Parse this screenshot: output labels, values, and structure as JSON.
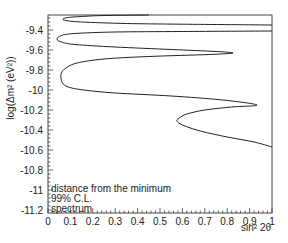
{
  "chart_data": {
    "type": "line",
    "title": "",
    "xlabel": "sin² 2θ",
    "ylabel": "log(Δm² (eV²))",
    "xlim": [
      0,
      1
    ],
    "ylim": [
      -11.23,
      -9.25
    ],
    "x_ticks": [
      0,
      0.1,
      0.2,
      0.3,
      0.4,
      0.5,
      0.6,
      0.7,
      0.8,
      0.9,
      1
    ],
    "x_tick_labels": [
      "0",
      "0.1",
      "0.2",
      "0.3",
      "0.4",
      "0.5",
      "0.6",
      "0.7",
      "0.8",
      "0.9",
      "1"
    ],
    "y_ticks": [
      -9.4,
      -9.6,
      -9.8,
      -10,
      -10.2,
      -10.4,
      -10.6,
      -10.8,
      -11,
      -11.2
    ],
    "y_tick_labels": [
      "-9.4",
      "-9.6",
      "-9.8",
      "-10",
      "-10.2",
      "-10.4",
      "-10.6",
      "-10.8",
      "-11",
      "-11.2"
    ],
    "grid": false,
    "legend": {
      "placement": "bottom-left",
      "entries": [
        "distance from the minimum",
        "99% C.L.",
        "spectrum"
      ]
    },
    "series": [
      {
        "name": "99% C.L. contour",
        "color": "#222222",
        "points": [
          [
            0.45,
            -9.25
          ],
          [
            0.25,
            -9.255
          ],
          [
            0.15,
            -9.265
          ],
          [
            0.09,
            -9.275
          ],
          [
            0.067,
            -9.29
          ],
          [
            0.08,
            -9.305
          ],
          [
            0.15,
            -9.32
          ],
          [
            0.35,
            -9.335
          ],
          [
            0.6,
            -9.342
          ],
          [
            1.0,
            -9.35
          ]
        ]
      },
      {
        "name": "99% C.L. contour (lower)",
        "color": "#222222",
        "points": [
          [
            1.0,
            -9.41
          ],
          [
            0.6,
            -9.415
          ],
          [
            0.3,
            -9.42
          ],
          [
            0.12,
            -9.435
          ],
          [
            0.06,
            -9.455
          ],
          [
            0.04,
            -9.49
          ],
          [
            0.06,
            -9.52
          ],
          [
            0.12,
            -9.545
          ],
          [
            0.3,
            -9.57
          ],
          [
            0.55,
            -9.595
          ],
          [
            0.75,
            -9.615
          ],
          [
            0.826,
            -9.63
          ],
          [
            0.72,
            -9.645
          ],
          [
            0.45,
            -9.665
          ],
          [
            0.25,
            -9.69
          ],
          [
            0.13,
            -9.73
          ],
          [
            0.08,
            -9.78
          ],
          [
            0.06,
            -9.83
          ],
          [
            0.058,
            -9.88
          ],
          [
            0.065,
            -9.93
          ],
          [
            0.09,
            -9.97
          ],
          [
            0.16,
            -10.0
          ],
          [
            0.3,
            -10.03
          ],
          [
            0.55,
            -10.06
          ],
          [
            0.78,
            -10.1
          ],
          [
            0.933,
            -10.15
          ],
          [
            0.82,
            -10.17
          ],
          [
            0.7,
            -10.2
          ],
          [
            0.62,
            -10.24
          ],
          [
            0.585,
            -10.28
          ],
          [
            0.576,
            -10.31
          ],
          [
            0.6,
            -10.35
          ],
          [
            0.68,
            -10.41
          ],
          [
            0.8,
            -10.47
          ],
          [
            0.92,
            -10.52
          ],
          [
            1.0,
            -10.57
          ]
        ]
      }
    ]
  }
}
